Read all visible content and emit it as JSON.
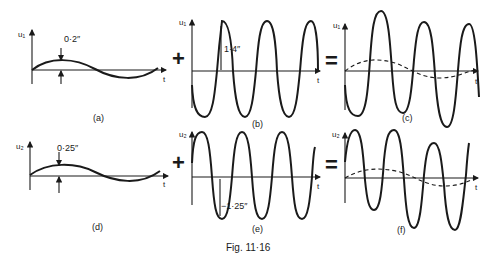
{
  "figure": {
    "caption": "Fig. 11·16",
    "operators": {
      "top_plus": "+",
      "top_equals": "=",
      "bottom_plus": "+",
      "bottom_equals": "="
    },
    "panels": [
      {
        "id": "a",
        "label": "(a)",
        "y_axis": "u₁",
        "x_axis": "t",
        "annotation": "0·2″",
        "description": "slow sinusoid, small amplitude"
      },
      {
        "id": "b",
        "label": "(b)",
        "y_axis": "u₁",
        "x_axis": "t",
        "annotation": "1·4″",
        "description": "fast sinusoid, large amplitude"
      },
      {
        "id": "c",
        "label": "(c)",
        "y_axis": "u₁",
        "x_axis": "t",
        "annotation": "",
        "description": "sum of (a) and (b); dashed slow component"
      },
      {
        "id": "d",
        "label": "(d)",
        "y_axis": "u₂",
        "x_axis": "t",
        "annotation": "0·25″",
        "description": "slow sinusoid, small amplitude"
      },
      {
        "id": "e",
        "label": "(e)",
        "y_axis": "u₂",
        "x_axis": "t",
        "annotation": "−1·25″",
        "description": "fast sinusoid, large amplitude"
      },
      {
        "id": "f",
        "label": "(f)",
        "y_axis": "u₂",
        "x_axis": "t",
        "annotation": "",
        "description": "sum of (d) and (e); dashed slow component"
      }
    ]
  }
}
